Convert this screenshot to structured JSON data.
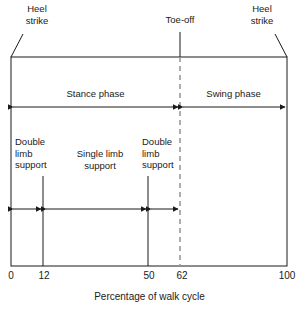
{
  "figure": {
    "axis_caption": "Percentage of walk cycle"
  },
  "callouts": {
    "heel_strike_left": "Heel\nstrike",
    "toe_off": "Toe-off",
    "heel_strike_right": "Heel\nstrike"
  },
  "phases": {
    "stance": "Stance phase",
    "swing": "Swing phase"
  },
  "support": {
    "double_limb_left": "Double\nlimb\nsupport",
    "single_limb": "Single limb\nsupport",
    "double_limb_right": "Double\nlimb\nsupport"
  },
  "axis": {
    "ticks": [
      {
        "label": "0",
        "value": 0
      },
      {
        "label": "12",
        "value": 12
      },
      {
        "label": "50",
        "value": 50
      },
      {
        "label": "62",
        "value": 62
      },
      {
        "label": "100",
        "value": 100
      }
    ]
  },
  "chart_data": {
    "type": "bar",
    "xlabel": "Percentage of walk cycle",
    "ylabel": "",
    "xlim": [
      0,
      100
    ],
    "grid": false,
    "legend": "none",
    "events": [
      {
        "name": "Heel strike",
        "percent": 0
      },
      {
        "name": "Toe-off",
        "percent": 62
      },
      {
        "name": "Heel strike",
        "percent": 100
      }
    ],
    "series": [
      {
        "name": "Gait phase",
        "row": 1,
        "segments": [
          {
            "label": "Stance phase",
            "start": 0,
            "end": 62
          },
          {
            "label": "Swing phase",
            "start": 62,
            "end": 100
          }
        ]
      },
      {
        "name": "Limb support",
        "row": 2,
        "segments": [
          {
            "label": "Double limb support",
            "start": 0,
            "end": 12
          },
          {
            "label": "Single limb support",
            "start": 12,
            "end": 50
          },
          {
            "label": "Double limb support",
            "start": 50,
            "end": 62
          }
        ]
      }
    ]
  },
  "colors": {
    "stroke": "#1a1a1a",
    "dashed": "#9a9a9a",
    "background": "#ffffff"
  }
}
